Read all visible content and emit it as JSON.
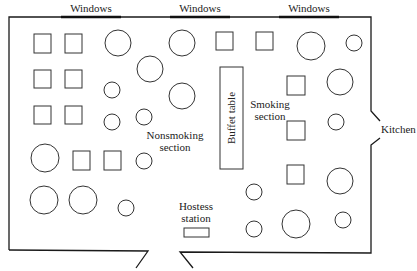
{
  "diagram": {
    "type": "floor_plan",
    "labels": {
      "window_1": "Windows",
      "window_2": "Windows",
      "window_3": "Windows",
      "kitchen": "Kitchen",
      "buffet": "Buffet table",
      "nonsmoking_1": "Nonsmoking",
      "nonsmoking_2": "section",
      "smoking_1": "Smoking",
      "smoking_2": "section",
      "hostess_1": "Hostess",
      "hostess_2": "station"
    },
    "colors": {
      "stroke": "#333333",
      "wall": "#1a1a1a",
      "background": "#ffffff"
    },
    "square_tables": [
      {
        "x": 34,
        "y": 34,
        "w": 17,
        "h": 19
      },
      {
        "x": 65,
        "y": 34,
        "w": 17,
        "h": 19
      },
      {
        "x": 34,
        "y": 70,
        "w": 17,
        "h": 18
      },
      {
        "x": 65,
        "y": 70,
        "w": 17,
        "h": 18
      },
      {
        "x": 34,
        "y": 106,
        "w": 17,
        "h": 18
      },
      {
        "x": 65,
        "y": 106,
        "w": 17,
        "h": 18
      },
      {
        "x": 73,
        "y": 151,
        "w": 17,
        "h": 19
      },
      {
        "x": 104,
        "y": 151,
        "w": 17,
        "h": 19
      },
      {
        "x": 216,
        "y": 32,
        "w": 17,
        "h": 18
      },
      {
        "x": 256,
        "y": 32,
        "w": 17,
        "h": 18
      },
      {
        "x": 287,
        "y": 76,
        "w": 18,
        "h": 19
      },
      {
        "x": 287,
        "y": 121,
        "w": 18,
        "h": 19
      },
      {
        "x": 287,
        "y": 165,
        "w": 17,
        "h": 19
      }
    ],
    "round_tables": [
      {
        "cx": 118,
        "cy": 43,
        "r": 13
      },
      {
        "cx": 182,
        "cy": 43,
        "r": 13
      },
      {
        "cx": 150,
        "cy": 69,
        "r": 13
      },
      {
        "cx": 112,
        "cy": 90,
        "r": 8
      },
      {
        "cx": 182,
        "cy": 96,
        "r": 13
      },
      {
        "cx": 144,
        "cy": 117,
        "r": 8
      },
      {
        "cx": 112,
        "cy": 122,
        "r": 8
      },
      {
        "cx": 45,
        "cy": 158,
        "r": 14
      },
      {
        "cx": 144,
        "cy": 161,
        "r": 8
      },
      {
        "cx": 44,
        "cy": 200,
        "r": 14
      },
      {
        "cx": 83,
        "cy": 200,
        "r": 14
      },
      {
        "cx": 126,
        "cy": 208,
        "r": 8
      },
      {
        "cx": 311,
        "cy": 46,
        "r": 14
      },
      {
        "cx": 354,
        "cy": 43,
        "r": 8
      },
      {
        "cx": 340,
        "cy": 82,
        "r": 13
      },
      {
        "cx": 336,
        "cy": 122,
        "r": 8
      },
      {
        "cx": 340,
        "cy": 181,
        "r": 13
      },
      {
        "cx": 254,
        "cy": 192,
        "r": 8
      },
      {
        "cx": 296,
        "cy": 224,
        "r": 14
      },
      {
        "cx": 343,
        "cy": 220,
        "r": 8
      },
      {
        "cx": 254,
        "cy": 229,
        "r": 8
      }
    ]
  }
}
